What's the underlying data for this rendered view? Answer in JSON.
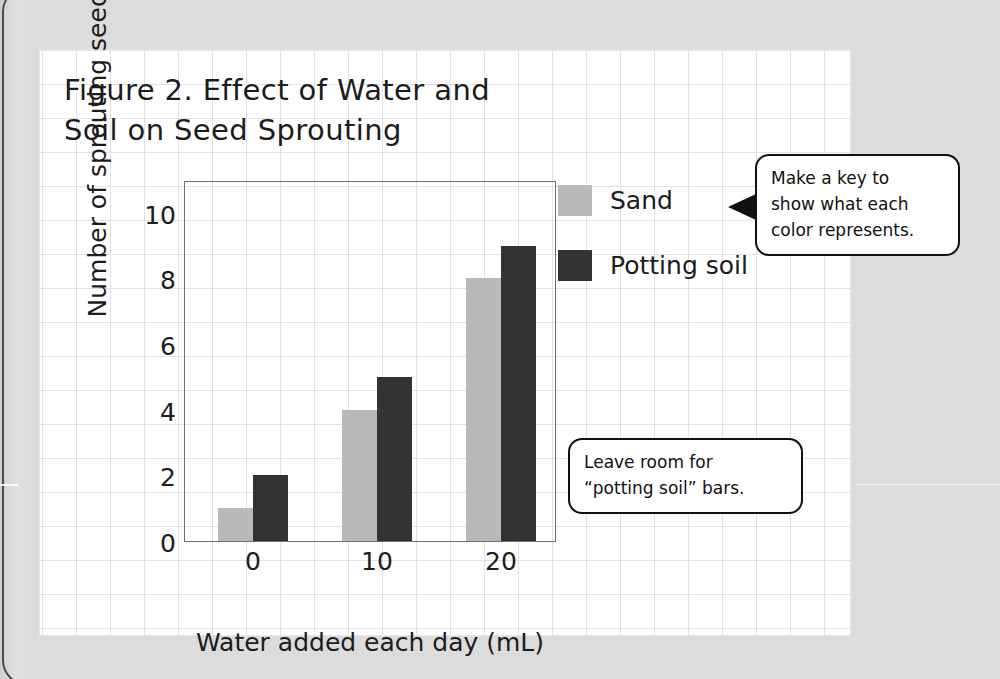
{
  "chart_data": {
    "type": "bar",
    "title": "Figure 2. Effect of Water and Soil on Seed Sprouting",
    "title_lines": [
      "Figure 2. Effect of Water and",
      "Soil on Seed Sprouting"
    ],
    "categories": [
      "0",
      "10",
      "20"
    ],
    "series": [
      {
        "name": "Sand",
        "values": [
          1,
          4,
          8
        ],
        "color": "#b9b9b9"
      },
      {
        "name": "Potting soil",
        "values": [
          2,
          5,
          9
        ],
        "color": "#333333"
      }
    ],
    "xlabel": "Water added each day (mL)",
    "ylabel": "Number of sprouting seeds",
    "ylim": [
      0,
      11
    ],
    "yticks": [
      "0",
      "2",
      "4",
      "6",
      "8",
      "10"
    ],
    "ytick_values": [
      0,
      2,
      4,
      6,
      8,
      10
    ],
    "xticks": [
      "0",
      "10",
      "20"
    ],
    "grid": true,
    "legend_position": "right"
  },
  "legend": {
    "entries": [
      {
        "label": "Sand",
        "color": "#b9b9b9"
      },
      {
        "label": "Potting soil",
        "color": "#333333"
      }
    ]
  },
  "callouts": [
    {
      "id": "make-a-key",
      "lines": [
        "Make a key to",
        "show what each",
        "color represents."
      ],
      "points_to": "legend"
    },
    {
      "id": "leave-room",
      "lines": [
        "Leave room for",
        "“potting soil” bars."
      ],
      "points_to": "plot"
    }
  ],
  "colors": {
    "sand_bar": "#b9b9b9",
    "potting_soil_bar": "#333333",
    "grid_line": "#dfe3e8",
    "axis_line": "#6e6e6e",
    "text": "#1c1c1c",
    "page_background": "#dcdcdc",
    "paper": "#ffffff"
  }
}
